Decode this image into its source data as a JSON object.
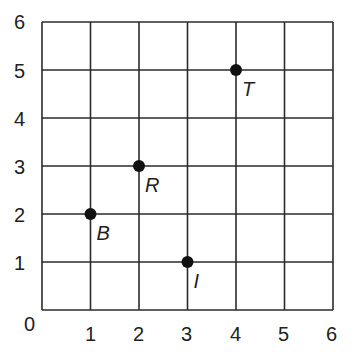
{
  "chart_data": {
    "type": "scatter",
    "title": "",
    "xlabel": "",
    "ylabel": "",
    "xlim": [
      0,
      6
    ],
    "ylim": [
      0,
      6
    ],
    "grid": true,
    "x_ticks": [
      "1",
      "2",
      "3",
      "4",
      "5",
      "6"
    ],
    "y_ticks": [
      "1",
      "2",
      "3",
      "4",
      "5",
      "6"
    ],
    "origin_label": "0",
    "points": [
      {
        "label": "B",
        "x": 1,
        "y": 2
      },
      {
        "label": "R",
        "x": 2,
        "y": 3
      },
      {
        "label": "I",
        "x": 3,
        "y": 1
      },
      {
        "label": "T",
        "x": 4,
        "y": 5
      }
    ],
    "colors": {
      "grid": "#2b2b2b",
      "point": "#111111",
      "text": "#222222"
    }
  }
}
